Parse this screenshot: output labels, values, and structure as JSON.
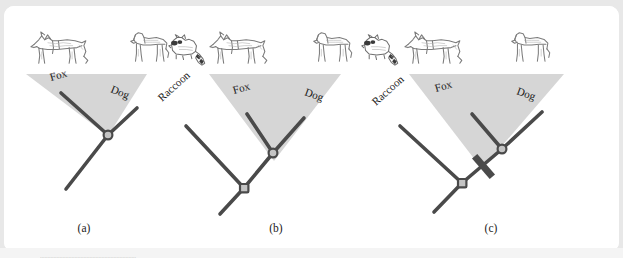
{
  "figure": {
    "kind": "phylogenetic-tree-diagram",
    "style": "textbook line drawing with shaded clade triangles and pencil-sketch animal illustrations",
    "background_color": "#e8e8e8",
    "card_color": "#ffffff",
    "branch_color": "#4a4a4a",
    "triangle_fill": "#d4d4d4",
    "node_fill": "#b5b5b5",
    "text_color": "#1a1a1a",
    "panels": [
      {
        "id": "a",
        "label": "(a)",
        "taxa": [
          "Fox",
          "Dog",
          "Raccoon"
        ],
        "animals": [
          "fox",
          "dog",
          "raccoon"
        ],
        "shaded_clade": [
          "Fox",
          "Dog"
        ],
        "has_hash_mark": false,
        "tip_labels": [
          {
            "text": "Fox",
            "x": 47,
            "y": 75,
            "rotate": -16
          },
          {
            "text": "Dog",
            "x": 106,
            "y": 86,
            "rotate": 22
          }
        ],
        "triangle": "22,68 143,68 104,130",
        "branches": [
          {
            "from": [
              104,
              129
            ],
            "to": [
              57,
              87
            ]
          },
          {
            "from": [
              104,
              129
            ],
            "to": [
              133,
              102
            ]
          },
          {
            "from": [
              104,
              129
            ],
            "to": [
              62,
              183
            ]
          }
        ],
        "nodes": [
          {
            "x": 104,
            "y": 129,
            "type": "circle"
          }
        ]
      },
      {
        "id": "b",
        "label": "(b)",
        "taxa": [
          "Raccoon",
          "Fox",
          "Dog"
        ],
        "animals": [
          "dog",
          "raccoon",
          "fox",
          "dog"
        ],
        "shaded_clade": [
          "Fox",
          "Dog"
        ],
        "has_hash_mark": false,
        "tip_labels": [
          {
            "text": "Raccoon",
            "x": 158,
            "y": 96,
            "rotate": -42
          },
          {
            "text": "Fox",
            "x": 230,
            "y": 88,
            "rotate": -16
          },
          {
            "text": "Dog",
            "x": 300,
            "y": 89,
            "rotate": 20
          }
        ],
        "triangle": "205,68 337,68 270,155",
        "branches": [
          {
            "from": [
              240,
              182
            ],
            "to": [
              182,
              120
            ]
          },
          {
            "from": [
              240,
              182
            ],
            "to": [
              269,
              147
            ]
          },
          {
            "from": [
              269,
              147
            ],
            "to": [
              243,
              108
            ]
          },
          {
            "from": [
              269,
              147
            ],
            "to": [
              300,
              112
            ]
          },
          {
            "from": [
              240,
              182
            ],
            "to": [
              216,
              208
            ]
          }
        ],
        "nodes": [
          {
            "x": 240,
            "y": 182,
            "type": "square"
          },
          {
            "x": 269,
            "y": 147,
            "type": "circle"
          }
        ]
      },
      {
        "id": "c",
        "label": "(c)",
        "taxa": [
          "Raccoon",
          "Fox",
          "Dog"
        ],
        "animals": [
          "raccoon",
          "fox",
          "dog"
        ],
        "shaded_clade": [
          "Fox",
          "Dog"
        ],
        "has_hash_mark": true,
        "hash_mark": {
          "x": 479,
          "y": 160,
          "rotate": 45,
          "length": 26,
          "thickness": 7
        },
        "tip_labels": [
          {
            "text": "Raccoon",
            "x": 372,
            "y": 100,
            "rotate": -42
          },
          {
            "text": "Fox",
            "x": 432,
            "y": 86,
            "rotate": -16
          },
          {
            "text": "Dog",
            "x": 512,
            "y": 88,
            "rotate": 20
          },
          {
            "text": "Dog",
            "x": 312,
            "y": 85,
            "rotate": 20
          }
        ],
        "triangle": "405,68 560,68 478,163",
        "branches": [
          {
            "from": [
              458,
              177
            ],
            "to": [
              396,
              120
            ]
          },
          {
            "from": [
              458,
              177
            ],
            "to": [
              498,
              143
            ]
          },
          {
            "from": [
              498,
              143
            ],
            "to": [
              468,
              108
            ]
          },
          {
            "from": [
              498,
              143
            ],
            "to": [
              538,
              106
            ]
          },
          {
            "from": [
              458,
              177
            ],
            "to": [
              430,
              206
            ]
          }
        ],
        "nodes": [
          {
            "x": 458,
            "y": 177,
            "type": "square"
          },
          {
            "x": 498,
            "y": 143,
            "type": "circle"
          }
        ]
      }
    ],
    "panel_captions": [
      {
        "text": "(a)",
        "x": 80,
        "y": 226
      },
      {
        "text": "(b)",
        "x": 272,
        "y": 226
      },
      {
        "text": "(c)",
        "x": 487,
        "y": 226
      }
    ],
    "animal_row": [
      {
        "kind": "fox",
        "x": 24,
        "y": 22,
        "w": 62,
        "h": 38,
        "flip": false
      },
      {
        "kind": "dog",
        "x": 122,
        "y": 22,
        "w": 46,
        "h": 38,
        "flip": false
      },
      {
        "kind": "raccoon",
        "x": 165,
        "y": 30,
        "w": 44,
        "h": 30,
        "flip": false
      },
      {
        "kind": "fox",
        "x": 205,
        "y": 22,
        "w": 62,
        "h": 38,
        "flip": false
      },
      {
        "kind": "dog",
        "x": 305,
        "y": 22,
        "w": 46,
        "h": 38,
        "flip": false
      },
      {
        "kind": "raccoon",
        "x": 358,
        "y": 30,
        "w": 44,
        "h": 30,
        "flip": false
      },
      {
        "kind": "fox",
        "x": 400,
        "y": 22,
        "w": 62,
        "h": 38,
        "flip": false
      },
      {
        "kind": "dog",
        "x": 503,
        "y": 22,
        "w": 46,
        "h": 38,
        "flip": false
      }
    ],
    "bottom_caption_text": "................................................................"
  }
}
